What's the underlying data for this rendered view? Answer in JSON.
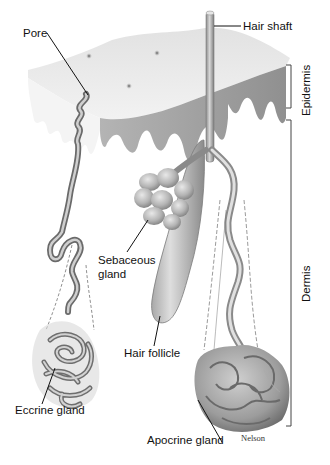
{
  "figure": {
    "signature": "Nelson"
  },
  "labels": {
    "pore": "Pore",
    "hair_shaft": "Hair shaft",
    "sebaceous_line1": "Sebaceous",
    "sebaceous_line2": "gland",
    "hair_follicle": "Hair follicle",
    "eccrine_gland": "Eccrine gland",
    "apocrine_gland": "Apocrine gland"
  },
  "layers": {
    "epidermis": "Epidermis",
    "dermis": "Dermis"
  },
  "colors": {
    "skin_surface": "#e6e6e6",
    "skin_shadow": "#9a9a9a",
    "gland_mid": "#b5b5b5",
    "gland_dark": "#7a7a7a",
    "text": "#111111"
  }
}
